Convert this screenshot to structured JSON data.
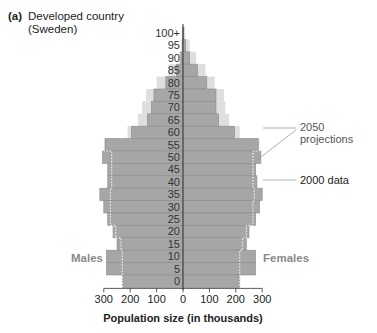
{
  "header": {
    "tag": "(a)",
    "title_line1": "Developed country",
    "title_line2": "(Sweden)"
  },
  "labels": {
    "males": "Males",
    "females": "Females",
    "projection_annotation_line1": "2050",
    "projection_annotation_line2": "projections",
    "data_annotation": "2000 data"
  },
  "colors": {
    "data_2000": "#a6a6a6",
    "projection_2050": "#dedede",
    "projection_outline": "#ffffff",
    "row_divider": "#8c8c8c",
    "axis": "#333333"
  },
  "chart_data": {
    "type": "bar",
    "subtype": "population-pyramid",
    "xlabel": "Population size (in thousands)",
    "ylabel": "Age",
    "xlim": [
      -300,
      300
    ],
    "x_ticks": [
      300,
      200,
      100,
      0,
      100,
      200,
      300
    ],
    "legend_position": "right annotations",
    "grid": false,
    "categories": [
      "100+",
      "95",
      "90",
      "85",
      "80",
      "75",
      "70",
      "65",
      "60",
      "55",
      "50",
      "45",
      "40",
      "35",
      "30",
      "25",
      "20",
      "15",
      "10",
      "5",
      "0"
    ],
    "series": [
      {
        "name": "2000 data - Males",
        "values": [
          1,
          2,
          8,
          25,
          65,
          110,
          120,
          135,
          195,
          295,
          305,
          285,
          285,
          315,
          300,
          285,
          265,
          250,
          290,
          290,
          230
        ]
      },
      {
        "name": "2000 data - Females",
        "values": [
          3,
          10,
          25,
          55,
          90,
          125,
          125,
          135,
          195,
          285,
          295,
          275,
          280,
          300,
          290,
          275,
          250,
          240,
          275,
          275,
          215
        ]
      },
      {
        "name": "2050 projections - Males",
        "values": [
          2,
          8,
          15,
          55,
          100,
          140,
          155,
          170,
          210,
          300,
          270,
          270,
          270,
          275,
          275,
          275,
          255,
          235,
          230,
          230,
          230
        ]
      },
      {
        "name": "2050 projections - Females",
        "values": [
          8,
          25,
          50,
          85,
          120,
          155,
          160,
          175,
          215,
          290,
          265,
          265,
          265,
          270,
          265,
          265,
          240,
          225,
          215,
          215,
          215
        ]
      }
    ],
    "annotations": [
      "2050 projections",
      "2000 data",
      "Males",
      "Females"
    ]
  }
}
